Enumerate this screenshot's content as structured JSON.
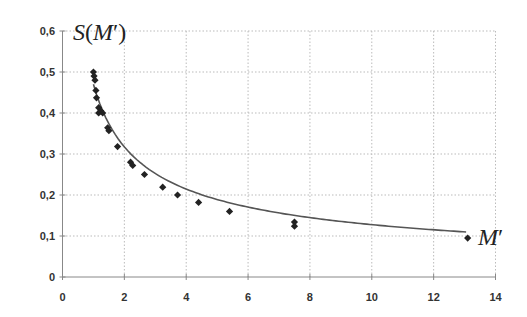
{
  "chart_data": {
    "type": "scatter",
    "title": "",
    "xlabel": "M′",
    "ylabel": "S(M′)",
    "xlim": [
      0,
      14
    ],
    "ylim": [
      0,
      0.6
    ],
    "x_ticks": [
      0,
      2,
      4,
      6,
      8,
      10,
      12,
      14
    ],
    "x_tick_labels": [
      "0",
      "2",
      "4",
      "6",
      "8",
      "10",
      "12",
      "14"
    ],
    "y_ticks": [
      0,
      0.1,
      0.2,
      0.3,
      0.4,
      0.5,
      0.6
    ],
    "y_tick_labels": [
      "0",
      "0,1",
      "0,2",
      "0,3",
      "0,4",
      "0,5",
      "0,6"
    ],
    "grid": true,
    "legend": null,
    "series": [
      {
        "name": "data",
        "marker": "diamond",
        "color": "#222222",
        "points": [
          [
            1.0,
            0.5
          ],
          [
            1.02,
            0.49
          ],
          [
            1.05,
            0.48
          ],
          [
            1.08,
            0.455
          ],
          [
            1.1,
            0.437
          ],
          [
            1.17,
            0.413
          ],
          [
            1.17,
            0.4
          ],
          [
            1.24,
            0.405
          ],
          [
            1.3,
            0.4
          ],
          [
            1.46,
            0.364
          ],
          [
            1.5,
            0.357
          ],
          [
            1.78,
            0.318
          ],
          [
            2.2,
            0.28
          ],
          [
            2.27,
            0.272
          ],
          [
            2.65,
            0.25
          ],
          [
            3.24,
            0.219
          ],
          [
            3.72,
            0.2
          ],
          [
            4.4,
            0.182
          ],
          [
            5.4,
            0.16
          ],
          [
            7.5,
            0.134
          ],
          [
            7.5,
            0.124
          ],
          [
            13.1,
            0.095
          ]
        ]
      },
      {
        "name": "power fit",
        "type": "line",
        "color": "#555555",
        "function": "y = 0.47 * x^-0.566",
        "x_range": [
          1.0,
          13.05
        ]
      }
    ],
    "axis_labels": {
      "y": "S(M′)",
      "x": "M′"
    }
  },
  "labels": {
    "y_axis_S": "S",
    "y_axis_paren_open": "(",
    "y_axis_M": "M",
    "y_axis_prime": "′",
    "y_axis_paren_close": ")",
    "x_axis_M": "M",
    "x_axis_prime": "′"
  }
}
